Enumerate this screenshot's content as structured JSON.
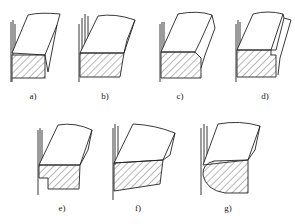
{
  "diagram": {
    "type": "cross-section figure set",
    "panels": [
      {
        "id": "a",
        "label": "a)",
        "x": 33,
        "y": 94,
        "shape": "rectangular section, flat top face, no chamfer"
      },
      {
        "id": "b",
        "label": "b)",
        "x": 105,
        "y": 94,
        "shape": "rectangular section with slightly tapered right side"
      },
      {
        "id": "c",
        "label": "c)",
        "x": 180,
        "y": 94,
        "shape": "section with chamfered top-right corner"
      },
      {
        "id": "d",
        "label": "d)",
        "x": 265,
        "y": 94,
        "shape": "section with stepped groove at top-right"
      },
      {
        "id": "e",
        "label": "e)",
        "x": 62,
        "y": 205,
        "shape": "section with notch at bottom-left"
      },
      {
        "id": "f",
        "label": "f)",
        "x": 138,
        "y": 205,
        "shape": "trapezoidal section with sloped bottom"
      },
      {
        "id": "g",
        "label": "g)",
        "x": 228,
        "y": 205,
        "shape": "section with rounded bottom-left (D-shape)"
      }
    ],
    "colors": {
      "line": "#222222",
      "background": "#ffffff"
    }
  }
}
